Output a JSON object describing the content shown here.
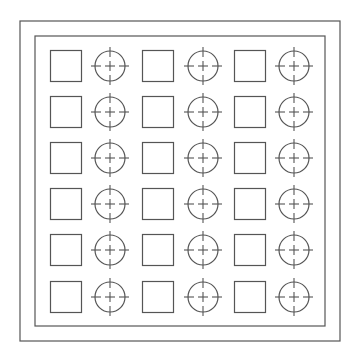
{
  "drawing": {
    "stroke_color": "#555555",
    "background": "#ffffff",
    "outer_frame": {
      "x": 20,
      "y": 21,
      "w": 320,
      "h": 320
    },
    "inner_frame": {
      "x": 35,
      "y": 36,
      "w": 290,
      "h": 290
    },
    "rows": 6,
    "columns": 6,
    "column_pattern": [
      "square",
      "circle-target",
      "square",
      "circle-target",
      "square",
      "circle-target"
    ],
    "column_centers_x": [
      66,
      110,
      158,
      203,
      250,
      294
    ],
    "row_centers_y": [
      66,
      112,
      158,
      204,
      250,
      297
    ],
    "square_size": 31,
    "circle_radius": 15,
    "crosshair_extent": 19,
    "center_cross_size": 5
  }
}
